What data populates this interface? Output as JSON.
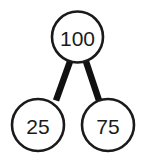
{
  "diagram": {
    "type": "number-bond",
    "background_color": "#ffffff",
    "stroke_color": "#1a1a1a",
    "text_color": "#1a1a1a",
    "edge_color": "#111111",
    "nodes": [
      {
        "id": "whole",
        "role": "whole",
        "label": "100",
        "cx": 77.5,
        "cy": 37,
        "r": 25.5,
        "stroke_width": 2.6,
        "font_size": 21
      },
      {
        "id": "part-left",
        "role": "part",
        "label": "25",
        "cx": 38,
        "cy": 125,
        "r": 26,
        "stroke_width": 2.6,
        "font_size": 21
      },
      {
        "id": "part-right",
        "role": "part",
        "label": "75",
        "cx": 108,
        "cy": 125,
        "r": 26,
        "stroke_width": 2.6,
        "font_size": 21
      }
    ],
    "edges": [
      {
        "id": "edge-whole-left",
        "from": "whole",
        "to": "part-left",
        "x1": 70,
        "y1": 61.5,
        "x2": 56,
        "y2": 100.5,
        "stroke_width": 6.5
      },
      {
        "id": "edge-whole-right",
        "from": "whole",
        "to": "part-right",
        "x1": 86,
        "y1": 61.5,
        "x2": 99,
        "y2": 100.5,
        "stroke_width": 6.5
      }
    ]
  }
}
